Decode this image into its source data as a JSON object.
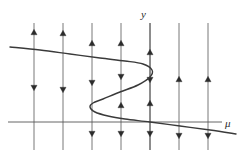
{
  "figure": {
    "kind": "phase-line-bifurcation-diagram",
    "title": "",
    "background_color": "#ffffff",
    "width": 244,
    "height": 159,
    "axis_label_y": "y",
    "axis_label_mu": "μ"
  },
  "chart_data": {
    "type": "line",
    "title": "",
    "xlabel": "μ",
    "ylabel": "y",
    "grid": false,
    "legend": null,
    "axes": {
      "mu_axis": {
        "name": "mu-axis",
        "orientation": "horizontal",
        "x_start": 8,
        "x_end": 222,
        "y": 122,
        "color": "#555555",
        "width": 0.9
      },
      "y_axis": {
        "name": "y-axis",
        "orientation": "vertical",
        "x": 150,
        "y_start": 23,
        "y_end": 150,
        "color": "#555555",
        "width": 0.9
      }
    },
    "curve": {
      "name": "equilibrium-curve",
      "description": "S-shaped (fold/hysteresis) equilibrium curve with two turning points",
      "color": "#3a3a3a",
      "stroke_width": 1.4,
      "turning_points": [
        {
          "label": "right-fold",
          "x": 153,
          "y": 68
        },
        {
          "label": "left-fold",
          "x": 90,
          "y": 104
        }
      ],
      "points": [
        {
          "x": 10,
          "y": 47
        },
        {
          "x": 40,
          "y": 50
        },
        {
          "x": 70,
          "y": 54
        },
        {
          "x": 100,
          "y": 58
        },
        {
          "x": 125,
          "y": 61
        },
        {
          "x": 143,
          "y": 64
        },
        {
          "x": 152,
          "y": 70
        },
        {
          "x": 150,
          "y": 77
        },
        {
          "x": 138,
          "y": 85
        },
        {
          "x": 120,
          "y": 92
        },
        {
          "x": 103,
          "y": 99
        },
        {
          "x": 93,
          "y": 103
        },
        {
          "x": 90,
          "y": 107
        },
        {
          "x": 95,
          "y": 112
        },
        {
          "x": 108,
          "y": 116
        },
        {
          "x": 125,
          "y": 119
        },
        {
          "x": 150,
          "y": 122
        },
        {
          "x": 180,
          "y": 126
        },
        {
          "x": 210,
          "y": 130
        },
        {
          "x": 236,
          "y": 134
        }
      ]
    },
    "vertical_flow_lines": [
      {
        "name": "flow-line-1",
        "x": 34,
        "y_top": 23,
        "y_bottom": 150,
        "curve_crossings": [
          44
        ],
        "arrows": [
          {
            "y": 32,
            "direction": "up"
          },
          {
            "y": 88,
            "direction": "down"
          }
        ]
      },
      {
        "name": "flow-line-2",
        "x": 63,
        "y_top": 23,
        "y_bottom": 150,
        "curve_crossings": [
          52
        ],
        "arrows": [
          {
            "y": 33,
            "direction": "up"
          },
          {
            "y": 90,
            "direction": "down"
          }
        ]
      },
      {
        "name": "flow-line-3",
        "x": 92,
        "y_top": 23,
        "y_bottom": 150,
        "curve_crossings": [
          56,
          104,
          111
        ],
        "arrows": [
          {
            "y": 43,
            "direction": "up"
          },
          {
            "y": 83,
            "direction": "down"
          },
          {
            "y": 134,
            "direction": "down"
          }
        ]
      },
      {
        "name": "flow-line-4",
        "x": 121,
        "y_top": 23,
        "y_bottom": 150,
        "curve_crossings": [
          60,
          92,
          118
        ],
        "arrows": [
          {
            "y": 43,
            "direction": "up"
          },
          {
            "y": 77,
            "direction": "down"
          },
          {
            "y": 105,
            "direction": "up"
          },
          {
            "y": 134,
            "direction": "down"
          }
        ]
      },
      {
        "name": "flow-line-5",
        "x": 150,
        "y_top": 23,
        "y_bottom": 150,
        "curve_crossings": [
          65,
          78,
          122
        ],
        "arrows": [
          {
            "y": 52,
            "direction": "up"
          },
          {
            "y": 80,
            "direction": "down"
          },
          {
            "y": 103,
            "direction": "up"
          },
          {
            "y": 134,
            "direction": "down"
          }
        ]
      },
      {
        "name": "flow-line-6",
        "x": 179,
        "y_top": 23,
        "y_bottom": 150,
        "curve_crossings": [
          126
        ],
        "arrows": [
          {
            "y": 79,
            "direction": "up"
          },
          {
            "y": 136,
            "direction": "down"
          }
        ]
      },
      {
        "name": "flow-line-7",
        "x": 208,
        "y_top": 23,
        "y_bottom": 150,
        "curve_crossings": [
          130
        ],
        "arrows": [
          {
            "y": 79,
            "direction": "up"
          },
          {
            "y": 136,
            "direction": "down"
          }
        ]
      }
    ],
    "colors": {
      "curve": "#3a3a3a",
      "flow_line": "#6a6a6a",
      "arrow": "#2b2b2b",
      "axis": "#555555",
      "label": "#2b2b2b"
    }
  }
}
